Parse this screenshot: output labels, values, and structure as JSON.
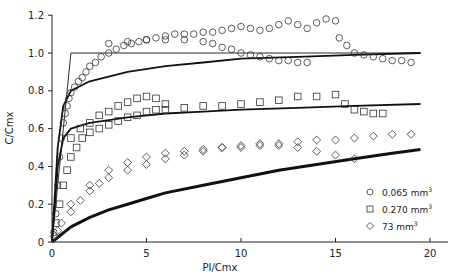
{
  "chart_data": {
    "type": "scatter",
    "title": "",
    "xlabel": "PI/Cmx",
    "ylabel": "C/Cmx",
    "xlim": [
      0,
      21
    ],
    "ylim": [
      0,
      1.2
    ],
    "xticks": [
      0,
      5,
      10,
      15,
      20
    ],
    "yticks": [
      0,
      0.2,
      0.4,
      0.6,
      0.8,
      1.0,
      1.2
    ],
    "ytick_labels": [
      "0",
      "0.2",
      "0.4",
      "0.6",
      "0.8",
      "1.0",
      "1.2"
    ],
    "grid": false,
    "legend_position": "lower right",
    "legend": [
      {
        "marker": "circle",
        "label": "0.065 mm",
        "sup": "3"
      },
      {
        "marker": "square",
        "label": "0.270 mm",
        "sup": "3"
      },
      {
        "marker": "diamond",
        "label": "73 mm",
        "sup": "3"
      }
    ],
    "series": [
      {
        "name": "0.065 mm3",
        "marker": "circle",
        "points": [
          [
            0.1,
            0.05
          ],
          [
            0.2,
            0.15
          ],
          [
            0.3,
            0.3
          ],
          [
            0.4,
            0.45
          ],
          [
            0.5,
            0.55
          ],
          [
            0.6,
            0.63
          ],
          [
            0.7,
            0.68
          ],
          [
            0.8,
            0.72
          ],
          [
            0.9,
            0.76
          ],
          [
            1.0,
            0.79
          ],
          [
            1.2,
            0.82
          ],
          [
            1.4,
            0.85
          ],
          [
            1.6,
            0.87
          ],
          [
            1.8,
            0.9
          ],
          [
            2.0,
            0.93
          ],
          [
            2.3,
            0.95
          ],
          [
            2.6,
            0.98
          ],
          [
            3.0,
            1.0
          ],
          [
            3.4,
            1.02
          ],
          [
            3.8,
            1.04
          ],
          [
            4.2,
            1.05
          ],
          [
            4.6,
            1.06
          ],
          [
            5.0,
            1.07
          ],
          [
            5.5,
            1.08
          ],
          [
            6.0,
            1.09
          ],
          [
            6.5,
            1.1
          ],
          [
            7.0,
            1.1
          ],
          [
            7.5,
            1.1
          ],
          [
            8.0,
            1.11
          ],
          [
            8.5,
            1.11
          ],
          [
            9.0,
            1.12
          ],
          [
            9.5,
            1.13
          ],
          [
            10.0,
            1.14
          ],
          [
            10.5,
            1.13
          ],
          [
            11.0,
            1.12
          ],
          [
            11.5,
            1.13
          ],
          [
            12.0,
            1.15
          ],
          [
            12.5,
            1.17
          ],
          [
            13.0,
            1.15
          ],
          [
            13.5,
            1.13
          ],
          [
            14.0,
            1.16
          ],
          [
            14.5,
            1.18
          ],
          [
            15.0,
            1.17
          ]
        ]
      },
      {
        "name": "0.065 mm3 (second run)",
        "marker": "circle",
        "points": [
          [
            3.0,
            1.05
          ],
          [
            4.0,
            1.06
          ],
          [
            5.0,
            1.07
          ],
          [
            6.0,
            1.07
          ],
          [
            7.0,
            1.07
          ],
          [
            8.0,
            1.06
          ],
          [
            8.5,
            1.05
          ],
          [
            9.0,
            1.03
          ],
          [
            9.5,
            1.02
          ],
          [
            10.0,
            1.0
          ],
          [
            10.5,
            0.99
          ],
          [
            11.0,
            0.98
          ],
          [
            11.5,
            0.97
          ],
          [
            12.0,
            0.96
          ],
          [
            12.5,
            0.96
          ],
          [
            13.0,
            0.95
          ],
          [
            13.5,
            0.95
          ],
          [
            15.2,
            1.08
          ],
          [
            15.6,
            1.04
          ],
          [
            16.0,
            1.0
          ],
          [
            16.5,
            0.99
          ],
          [
            17.0,
            0.98
          ],
          [
            17.5,
            0.97
          ],
          [
            18.0,
            0.96
          ],
          [
            18.5,
            0.96
          ],
          [
            19.0,
            0.95
          ]
        ]
      },
      {
        "name": "0.270 mm3",
        "marker": "square",
        "points": [
          [
            0.2,
            0.1
          ],
          [
            0.4,
            0.2
          ],
          [
            0.6,
            0.3
          ],
          [
            0.8,
            0.38
          ],
          [
            1.0,
            0.45
          ],
          [
            1.3,
            0.5
          ],
          [
            1.6,
            0.55
          ],
          [
            2.0,
            0.58
          ],
          [
            2.5,
            0.6
          ],
          [
            3.0,
            0.62
          ],
          [
            3.5,
            0.64
          ],
          [
            4.0,
            0.66
          ],
          [
            4.5,
            0.67
          ],
          [
            5.0,
            0.69
          ],
          [
            5.5,
            0.7
          ],
          [
            6.0,
            0.7
          ],
          [
            7.0,
            0.71
          ],
          [
            8.0,
            0.72
          ],
          [
            9.0,
            0.72
          ],
          [
            10.0,
            0.73
          ],
          [
            11.0,
            0.74
          ],
          [
            12.0,
            0.75
          ],
          [
            13.0,
            0.77
          ],
          [
            14.0,
            0.77
          ],
          [
            15.0,
            0.78
          ],
          [
            15.5,
            0.73
          ],
          [
            16.0,
            0.7
          ],
          [
            16.5,
            0.69
          ],
          [
            17.0,
            0.68
          ],
          [
            17.5,
            0.68
          ]
        ]
      },
      {
        "name": "0.270 mm3 (second run)",
        "marker": "square",
        "points": [
          [
            1.0,
            0.55
          ],
          [
            1.5,
            0.6
          ],
          [
            2.0,
            0.63
          ],
          [
            2.5,
            0.67
          ],
          [
            3.0,
            0.69
          ],
          [
            3.5,
            0.72
          ],
          [
            4.0,
            0.74
          ],
          [
            4.5,
            0.76
          ],
          [
            5.0,
            0.77
          ],
          [
            5.5,
            0.76
          ],
          [
            6.0,
            0.73
          ]
        ]
      },
      {
        "name": "73 mm3",
        "marker": "diamond",
        "points": [
          [
            0.1,
            0.03
          ],
          [
            0.3,
            0.06
          ],
          [
            0.5,
            0.1
          ],
          [
            1.0,
            0.16
          ],
          [
            1.5,
            0.22
          ],
          [
            2.0,
            0.27
          ],
          [
            2.5,
            0.31
          ],
          [
            3.0,
            0.34
          ],
          [
            4.0,
            0.38
          ],
          [
            5.0,
            0.41
          ],
          [
            6.0,
            0.44
          ],
          [
            7.0,
            0.46
          ],
          [
            8.0,
            0.48
          ],
          [
            9.0,
            0.5
          ],
          [
            10.0,
            0.51
          ],
          [
            11.0,
            0.52
          ],
          [
            12.0,
            0.52
          ],
          [
            13.0,
            0.53
          ],
          [
            14.0,
            0.54
          ],
          [
            15.0,
            0.54
          ],
          [
            16.0,
            0.55
          ],
          [
            17.0,
            0.56
          ],
          [
            18.0,
            0.57
          ],
          [
            19.0,
            0.57
          ]
        ]
      },
      {
        "name": "73 mm3 (second run)",
        "marker": "diamond",
        "points": [
          [
            1.0,
            0.2
          ],
          [
            2.0,
            0.3
          ],
          [
            3.0,
            0.38
          ],
          [
            4.0,
            0.42
          ],
          [
            5.0,
            0.45
          ],
          [
            6.0,
            0.47
          ],
          [
            7.0,
            0.48
          ],
          [
            8.0,
            0.49
          ],
          [
            9.0,
            0.5
          ],
          [
            10.0,
            0.5
          ],
          [
            11.0,
            0.51
          ],
          [
            12.0,
            0.51
          ],
          [
            13.0,
            0.5
          ],
          [
            14.0,
            0.48
          ],
          [
            15.0,
            0.46
          ],
          [
            16.0,
            0.44
          ]
        ]
      }
    ],
    "lines": [
      {
        "name": "ideal (thin)",
        "style": "thin",
        "points": [
          [
            0,
            0
          ],
          [
            1.0,
            1.0
          ],
          [
            19.5,
            1.0
          ]
        ]
      },
      {
        "name": "model 0.065",
        "style": "medium",
        "points": [
          [
            0,
            0
          ],
          [
            0.3,
            0.5
          ],
          [
            0.6,
            0.72
          ],
          [
            1.0,
            0.8
          ],
          [
            2.0,
            0.85
          ],
          [
            4.0,
            0.9
          ],
          [
            6.0,
            0.93
          ],
          [
            8.0,
            0.95
          ],
          [
            10.0,
            0.97
          ],
          [
            13.0,
            0.98
          ],
          [
            16.0,
            0.99
          ],
          [
            19.5,
            1.0
          ]
        ]
      },
      {
        "name": "model 0.270",
        "style": "medium",
        "points": [
          [
            0,
            0
          ],
          [
            0.3,
            0.4
          ],
          [
            0.6,
            0.55
          ],
          [
            1.0,
            0.6
          ],
          [
            2.0,
            0.63
          ],
          [
            4.0,
            0.66
          ],
          [
            6.0,
            0.68
          ],
          [
            8.0,
            0.69
          ],
          [
            10.0,
            0.7
          ],
          [
            13.0,
            0.71
          ],
          [
            16.0,
            0.72
          ],
          [
            19.5,
            0.73
          ]
        ]
      },
      {
        "name": "model 73",
        "style": "thick",
        "points": [
          [
            0,
            0
          ],
          [
            1.0,
            0.08
          ],
          [
            2.0,
            0.13
          ],
          [
            3.0,
            0.17
          ],
          [
            4.0,
            0.2
          ],
          [
            5.0,
            0.23
          ],
          [
            6.0,
            0.26
          ],
          [
            8.0,
            0.3
          ],
          [
            10.0,
            0.34
          ],
          [
            12.0,
            0.38
          ],
          [
            14.0,
            0.41
          ],
          [
            16.0,
            0.44
          ],
          [
            18.0,
            0.47
          ],
          [
            19.5,
            0.49
          ]
        ]
      }
    ]
  }
}
